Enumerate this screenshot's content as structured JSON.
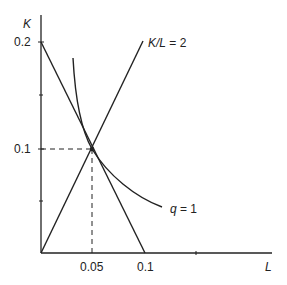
{
  "diagram": {
    "type": "isoquant-cost-diagram",
    "axes": {
      "x": {
        "label": "L",
        "ticks": [
          {
            "value": 0.05,
            "label": "0.05"
          },
          {
            "value": 0.1,
            "label": "0.1"
          }
        ]
      },
      "y": {
        "label": "K",
        "ticks": [
          {
            "value": 0.1,
            "label": "0.1"
          },
          {
            "value": 0.2,
            "label": "0.2"
          }
        ]
      }
    },
    "curves": {
      "expansion_ray": {
        "label": "K/L = 2",
        "label_parts": {
          "k": "K",
          "slash_l": "/L",
          "eq": " = 2"
        }
      },
      "isoquant": {
        "label": "q = 1",
        "label_parts": {
          "q": "q",
          "eq": " = 1"
        }
      },
      "isocost": {
        "label": "",
        "from": [
          0,
          0.2
        ],
        "to": [
          0.1,
          0
        ]
      }
    },
    "tangency_point": {
      "L": 0.05,
      "K": 0.1
    },
    "colors": {
      "line": "#222222",
      "background": "#ffffff"
    }
  }
}
